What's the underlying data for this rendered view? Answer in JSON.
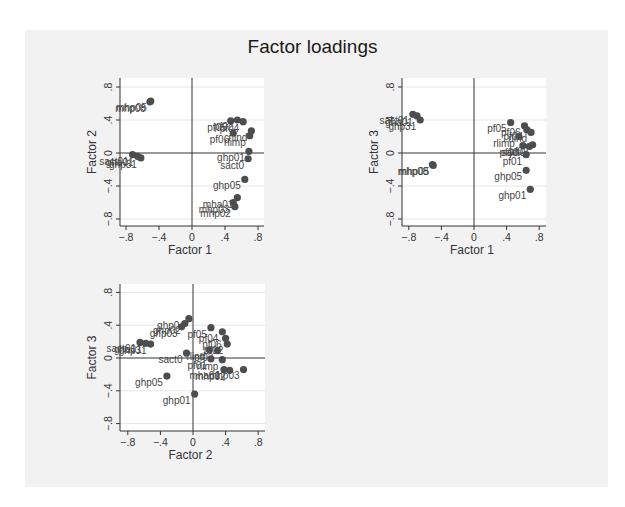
{
  "title": "Factor loadings",
  "colors": {
    "background": "#f2f2f2",
    "plot_region": "#ffffff",
    "marker": "#4d4d4d",
    "axis": "#333333",
    "grid": "#e6e6e6"
  },
  "chart_data": [
    {
      "type": "scatter",
      "title": "Factor loadings",
      "xlabel": "Factor 1",
      "ylabel": "Factor 2",
      "xticks": [
        "-.8",
        "-.4",
        "0",
        ".4",
        ".8"
      ],
      "yticks": [
        "-.8",
        "-.4",
        "0",
        ".4",
        ".8"
      ],
      "xlim": [
        -0.9,
        0.88
      ],
      "ylim": [
        -0.92,
        0.9
      ],
      "grid": true,
      "points": [
        {
          "label": "mhp05",
          "x": -0.5,
          "y": 0.63
        },
        {
          "label": "mhp08",
          "x": -0.51,
          "y": 0.62
        },
        {
          "label": "sact01",
          "x": -0.72,
          "y": -0.02
        },
        {
          "label": "gha01",
          "x": -0.66,
          "y": -0.04
        },
        {
          "label": "ghp31",
          "x": -0.62,
          "y": -0.06
        },
        {
          "label": "pf05",
          "x": 0.47,
          "y": 0.39
        },
        {
          "label": "pf02",
          "x": 0.55,
          "y": 0.4
        },
        {
          "label": "pf04",
          "x": 0.62,
          "y": 0.38
        },
        {
          "label": "rlind",
          "x": 0.72,
          "y": 0.27
        },
        {
          "label": "rlimp",
          "x": 0.7,
          "y": 0.21
        },
        {
          "label": "pf06",
          "x": 0.5,
          "y": 0.24
        },
        {
          "label": "ghp01",
          "x": 0.69,
          "y": 0.02
        },
        {
          "label": "sact0",
          "x": 0.68,
          "y": -0.07
        },
        {
          "label": "ghp05",
          "x": 0.64,
          "y": -0.32
        },
        {
          "label": "mha01",
          "x": 0.55,
          "y": -0.54
        },
        {
          "label": "mhp03",
          "x": 0.5,
          "y": -0.6
        },
        {
          "label": "mhp02",
          "x": 0.52,
          "y": -0.65
        }
      ]
    },
    {
      "type": "scatter",
      "xlabel": "Factor 1",
      "ylabel": "Factor 3",
      "xticks": [
        "-.8",
        "-.4",
        "0",
        ".4",
        ".8"
      ],
      "yticks": [
        "-.8",
        "-.4",
        "0",
        ".4",
        ".8"
      ],
      "xlim": [
        -0.9,
        0.88
      ],
      "ylim": [
        -0.92,
        0.9
      ],
      "grid": true,
      "points": [
        {
          "label": "sact01",
          "x": -0.75,
          "y": 0.47
        },
        {
          "label": "gha01",
          "x": -0.7,
          "y": 0.45
        },
        {
          "label": "ghp31",
          "x": -0.66,
          "y": 0.4
        },
        {
          "label": "mhp05",
          "x": -0.5,
          "y": -0.15
        },
        {
          "label": "mhp08",
          "x": -0.51,
          "y": -0.14
        },
        {
          "label": "pf05",
          "x": 0.45,
          "y": 0.37
        },
        {
          "label": "pf06",
          "x": 0.62,
          "y": 0.33
        },
        {
          "label": "pf04",
          "x": 0.65,
          "y": 0.28
        },
        {
          "label": "rlind",
          "x": 0.7,
          "y": 0.25
        },
        {
          "label": "rlimp",
          "x": 0.55,
          "y": 0.2
        },
        {
          "label": "pf02",
          "x": 0.72,
          "y": 0.1
        },
        {
          "label": "pf03",
          "x": 0.6,
          "y": 0.09
        },
        {
          "label": "sact0",
          "x": 0.68,
          "y": 0.08
        },
        {
          "label": "pf01",
          "x": 0.64,
          "y": -0.02
        },
        {
          "label": "ghp05",
          "x": 0.64,
          "y": -0.21
        },
        {
          "label": "ghp01",
          "x": 0.69,
          "y": -0.44
        }
      ]
    },
    {
      "type": "scatter",
      "xlabel": "Factor 2",
      "ylabel": "Factor 3",
      "xticks": [
        "-.8",
        "-.4",
        "0",
        ".4",
        ".8"
      ],
      "yticks": [
        "-.8",
        "-.4",
        "0",
        ".4",
        ".8"
      ],
      "xlim": [
        -0.9,
        0.88
      ],
      "ylim": [
        -0.92,
        0.9
      ],
      "grid": true,
      "points": [
        {
          "label": "sact01",
          "x": -0.65,
          "y": 0.19
        },
        {
          "label": "gha01",
          "x": -0.58,
          "y": 0.18
        },
        {
          "label": "ghp31",
          "x": -0.52,
          "y": 0.17
        },
        {
          "label": "ghp04",
          "x": -0.05,
          "y": 0.48
        },
        {
          "label": "ghp02",
          "x": -0.1,
          "y": 0.42
        },
        {
          "label": "ghp03",
          "x": -0.14,
          "y": 0.38
        },
        {
          "label": "pf05",
          "x": 0.22,
          "y": 0.37
        },
        {
          "label": "pf04",
          "x": 0.36,
          "y": 0.32
        },
        {
          "label": "pf06",
          "x": 0.4,
          "y": 0.24
        },
        {
          "label": "pf02",
          "x": 0.42,
          "y": 0.17
        },
        {
          "label": "pf03",
          "x": 0.3,
          "y": 0.09
        },
        {
          "label": "rlind",
          "x": 0.2,
          "y": 0.1
        },
        {
          "label": "sact0",
          "x": -0.08,
          "y": 0.06
        },
        {
          "label": "rlimp",
          "x": 0.36,
          "y": -0.02
        },
        {
          "label": "pf01",
          "x": 0.22,
          "y": -0.01
        },
        {
          "label": "mha01",
          "x": 0.38,
          "y": -0.14
        },
        {
          "label": "mhp02",
          "x": 0.45,
          "y": -0.15
        },
        {
          "label": "mhp03",
          "x": 0.62,
          "y": -0.14
        },
        {
          "label": "ghp05",
          "x": -0.32,
          "y": -0.22
        },
        {
          "label": "ghp01",
          "x": 0.02,
          "y": -0.44
        }
      ]
    }
  ],
  "panels": [
    {
      "name": "panel-f1-f2",
      "x_label": "Factor 1",
      "y_label": "Factor 2"
    },
    {
      "name": "panel-f1-f3",
      "x_label": "Factor 1",
      "y_label": "Factor 3"
    },
    {
      "name": "panel-f2-f3",
      "x_label": "Factor 2",
      "y_label": "Factor 3"
    }
  ]
}
